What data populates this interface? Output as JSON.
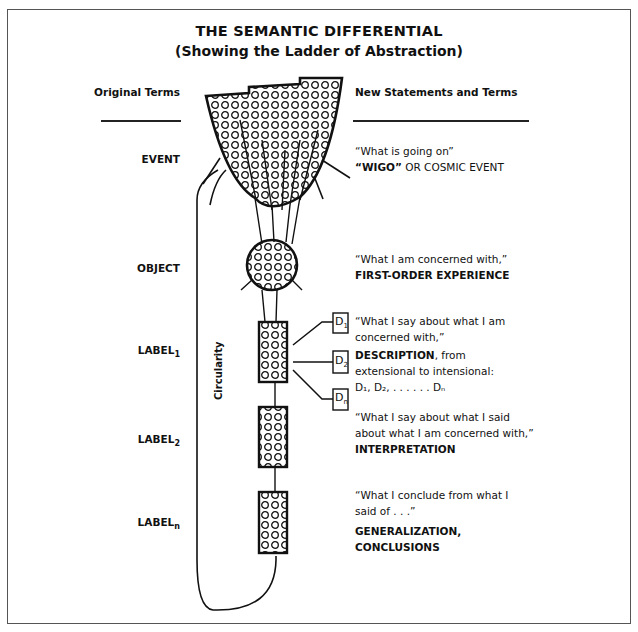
{
  "title": "THE SEMANTIC DIFFERENTIAL",
  "subtitle": "(Showing the Ladder of Abstraction)",
  "columns": {
    "left_header": "Original Terms",
    "right_header": "New Statements and Terms"
  },
  "levels": [
    {
      "name": "EVENT",
      "sub": ""
    },
    {
      "name": "OBJECT",
      "sub": ""
    },
    {
      "name": "LABEL",
      "sub": "1"
    },
    {
      "name": "LABEL",
      "sub": "2"
    },
    {
      "name": "LABEL",
      "sub": "n"
    }
  ],
  "statements": [
    {
      "quote": "“What is going on”",
      "term": "“WIGO”",
      "term_rest": " OR COSMIC EVENT"
    },
    {
      "quote": "“What I am concerned with,”",
      "term": "FIRST-ORDER EXPERIENCE"
    },
    {
      "quote_line1": "“What I say about what I am",
      "quote_line2": "concerned with,”",
      "term": "DESCRIPTION",
      "term_rest": ", from",
      "detail_line1": "extensional to intensional:",
      "detail_line2": "D₁, D₂, . . . . . . Dₙ"
    },
    {
      "quote_line1": "“What I say about what I said",
      "quote_line2": "about what I am concerned with,”",
      "term": "INTERPRETATION"
    },
    {
      "quote_line1": "“What I conclude from what I",
      "quote_line2": "said of . . .”",
      "term_line1": "GENERALIZATION,",
      "term_line2": "CONCLUSIONS"
    }
  ],
  "descriptions": [
    {
      "label": "D",
      "sub": "1"
    },
    {
      "label": "D",
      "sub": "2"
    },
    {
      "label": "D",
      "sub": "n"
    }
  ],
  "loop_label": "Circularity"
}
